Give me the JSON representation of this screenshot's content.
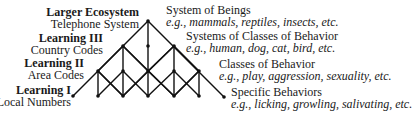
{
  "left_labels": [
    {
      "title": "Larger Ecosystem",
      "subtitle": "Telephone System"
    },
    {
      "title": "Learning III",
      "subtitle": "Country Codes"
    },
    {
      "title": "Learning II",
      "subtitle": "Area Codes"
    },
    {
      "title": "Learning I",
      "subtitle": "Local Numbers"
    }
  ],
  "right_labels": [
    {
      "title": "System of Beings",
      "examples": "e.g., mammals, reptiles, insects, etc."
    },
    {
      "title": "Systems of Classes of Behavior",
      "examples": "e.g., human, dog, cat, bird, etc."
    },
    {
      "title": "Classes of Behavior",
      "examples": "e.g., play, aggression, sexuality, etc."
    },
    {
      "title": "Specific Behaviors",
      "examples": "e.g., licking, growling, salivating, etc."
    }
  ]
}
